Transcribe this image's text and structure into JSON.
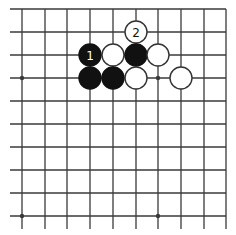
{
  "diagram": {
    "type": "go-board-fragment",
    "background": "#ffffff",
    "line_color": "#3a3a3a",
    "grid": {
      "columns": 10,
      "rows": 10,
      "x_positions": [
        22,
        45,
        67,
        90,
        113,
        136,
        158,
        181,
        204,
        226
      ],
      "y_positions": [
        9,
        32,
        55,
        78,
        101,
        124,
        147,
        170,
        193,
        216
      ],
      "h_line_start_x": 10,
      "h_line_end_x": 226,
      "v_line_start_y": 9,
      "v_line_end_y": 229
    },
    "star_points": [
      {
        "col": 0,
        "row": 3
      },
      {
        "col": 6,
        "row": 3
      },
      {
        "col": 0,
        "row": 9
      },
      {
        "col": 6,
        "row": 9
      }
    ],
    "stone_radius": 11,
    "stones": [
      {
        "col": 5,
        "row": 1,
        "color": "white",
        "label": "2"
      },
      {
        "col": 3,
        "row": 2,
        "color": "black",
        "label": "1"
      },
      {
        "col": 4,
        "row": 2,
        "color": "white",
        "label": ""
      },
      {
        "col": 5,
        "row": 2,
        "color": "black",
        "label": ""
      },
      {
        "col": 6,
        "row": 2,
        "color": "white",
        "label": ""
      },
      {
        "col": 3,
        "row": 3,
        "color": "black",
        "label": ""
      },
      {
        "col": 4,
        "row": 3,
        "color": "black",
        "label": ""
      },
      {
        "col": 5,
        "row": 3,
        "color": "white",
        "label": ""
      },
      {
        "col": 7,
        "row": 3,
        "color": "white",
        "label": ""
      }
    ],
    "colors": {
      "black_stone": "#111111",
      "white_stone_fill": "#ffffff",
      "white_stone_stroke": "#333333",
      "label_on_black": "#ffffff",
      "label_on_white": "#111111"
    }
  }
}
